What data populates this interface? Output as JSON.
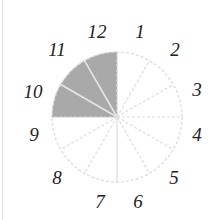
{
  "diagram": {
    "type": "clock-fraction-circle",
    "center": [
      117,
      117
    ],
    "radius": 65,
    "sectors": 12,
    "shaded_sectors": [
      10,
      11,
      12
    ],
    "colors": {
      "shaded": "#a9a9a9",
      "lines": "#dcdcdc",
      "text": "#222222"
    },
    "labels": [
      {
        "text": "12",
        "x": 97,
        "y": 38
      },
      {
        "text": "1",
        "x": 140,
        "y": 38
      },
      {
        "text": "2",
        "x": 175,
        "y": 56
      },
      {
        "text": "3",
        "x": 197,
        "y": 96
      },
      {
        "text": "4",
        "x": 197,
        "y": 141
      },
      {
        "text": "5",
        "x": 174,
        "y": 184
      },
      {
        "text": "6",
        "x": 138,
        "y": 208
      },
      {
        "text": "7",
        "x": 100,
        "y": 208
      },
      {
        "text": "8",
        "x": 57,
        "y": 184
      },
      {
        "text": "9",
        "x": 34,
        "y": 141
      },
      {
        "text": "10",
        "x": 33,
        "y": 98
      },
      {
        "text": "11",
        "x": 57,
        "y": 56
      }
    ]
  }
}
